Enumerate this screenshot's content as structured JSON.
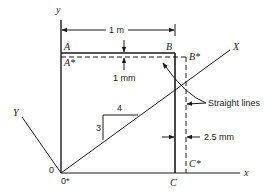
{
  "diagram": {
    "axes": {
      "x_label": "x",
      "y_label": "y",
      "rotated_x_label": "X",
      "rotated_y_label": "Y",
      "origin_label": "0",
      "origin_deformed_label": "0*"
    },
    "points": {
      "A": "A",
      "A_star": "A*",
      "B": "B",
      "B_star": "B*",
      "C": "C",
      "C_star": "C*"
    },
    "dimensions": {
      "width": "1 m",
      "vertical_shift": "1 mm",
      "horizontal_shift": "2.5 mm"
    },
    "slope": {
      "rise": "3",
      "run": "4"
    },
    "annotation": "Straight lines",
    "colors": {
      "line": "#1a1a1a",
      "background": "#ffffff"
    }
  }
}
